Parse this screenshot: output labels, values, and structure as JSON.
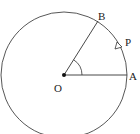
{
  "diagram": {
    "type": "circle-angle",
    "colors": {
      "stroke": "#333333",
      "background": "#ffffff"
    },
    "center": {
      "label": "O",
      "x": 64,
      "y": 75
    },
    "radius": 63,
    "points": [
      {
        "id": "A",
        "label": "A",
        "x": 127,
        "y": 75
      },
      {
        "id": "B",
        "label": "B",
        "x": 98,
        "y": 22
      },
      {
        "id": "P",
        "label": "P",
        "x": 118,
        "y": 46,
        "note": "moving point with direction arrow on circle"
      }
    ],
    "segments": [
      {
        "from": "O",
        "to": "A"
      },
      {
        "from": "O",
        "to": "B"
      }
    ],
    "angle_mark": {
      "vertex": "O",
      "between": [
        "A",
        "B"
      ]
    }
  }
}
